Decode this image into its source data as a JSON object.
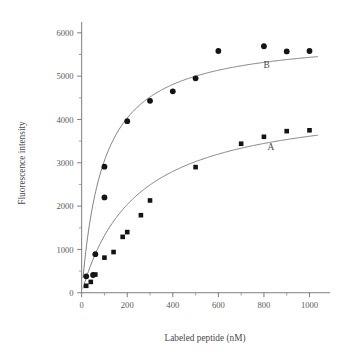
{
  "chart_data": {
    "type": "scatter",
    "title": "",
    "xlabel": "Labeled peptide (nM)",
    "ylabel": "Fluorescence intensity",
    "xlim": [
      -60,
      1090
    ],
    "ylim": [
      -260,
      6250
    ],
    "xticks": [
      0,
      200,
      400,
      600,
      800,
      1000
    ],
    "xtick_labels": [
      "0",
      "200",
      "400",
      "600",
      "800",
      "1000"
    ],
    "xminor_step": 100,
    "yticks": [
      0,
      1000,
      2000,
      3000,
      4000,
      5000,
      6000
    ],
    "ytick_labels": [
      "0",
      "1000",
      "2000",
      "3000",
      "4000",
      "5000",
      "6000"
    ],
    "yminor_step": 500,
    "grid": false,
    "legend": "inline-annotations",
    "series": [
      {
        "name": "A",
        "marker": "square",
        "marker_size": 4.1,
        "color": "#141414",
        "annotation": "A",
        "annotation_x": 830,
        "annotation_y": 3290,
        "points": [
          {
            "x": 20,
            "y": 160
          },
          {
            "x": 40,
            "y": 250
          },
          {
            "x": 60,
            "y": 420
          },
          {
            "x": 100,
            "y": 810
          },
          {
            "x": 140,
            "y": 940
          },
          {
            "x": 180,
            "y": 1290
          },
          {
            "x": 200,
            "y": 1400
          },
          {
            "x": 260,
            "y": 1790
          },
          {
            "x": 300,
            "y": 2130
          },
          {
            "x": 500,
            "y": 2900
          },
          {
            "x": 700,
            "y": 3440
          },
          {
            "x": 800,
            "y": 3600
          },
          {
            "x": 900,
            "y": 3730
          },
          {
            "x": 1000,
            "y": 3750
          }
        ],
        "fit": {
          "model": "hyperbolic",
          "bmax": 4480,
          "kd": 240
        }
      },
      {
        "name": "B",
        "marker": "circle",
        "marker_size": 4.6,
        "color": "#141414",
        "annotation": "B",
        "annotation_x": 812,
        "annotation_y": 5180,
        "points": [
          {
            "x": 20,
            "y": 380
          },
          {
            "x": 50,
            "y": 410
          },
          {
            "x": 60,
            "y": 890
          },
          {
            "x": 100,
            "y": 2200
          },
          {
            "x": 100,
            "y": 2910
          },
          {
            "x": 200,
            "y": 3960
          },
          {
            "x": 300,
            "y": 4430
          },
          {
            "x": 400,
            "y": 4650
          },
          {
            "x": 500,
            "y": 4950
          },
          {
            "x": 600,
            "y": 5580
          },
          {
            "x": 800,
            "y": 5690
          },
          {
            "x": 900,
            "y": 5570
          },
          {
            "x": 1000,
            "y": 5580
          }
        ],
        "fit": {
          "model": "hyperbolic",
          "bmax": 5950,
          "kd": 95
        }
      }
    ]
  }
}
